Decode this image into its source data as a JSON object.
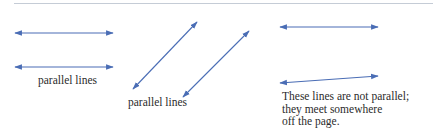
{
  "figure": {
    "line_color": "#4a6db5",
    "text_color": "#2b2b2b",
    "rule_color": "#c5ccd6",
    "groups": [
      {
        "id": "left-pair",
        "label": "parallel lines",
        "lines": [
          {
            "x1": 15,
            "y1": 33,
            "x2": 113,
            "y2": 33
          },
          {
            "x1": 15,
            "y1": 67,
            "x2": 113,
            "y2": 67
          }
        ]
      },
      {
        "id": "diagonal-pair",
        "label": "parallel lines",
        "lines": [
          {
            "x1": 133,
            "y1": 89,
            "x2": 197,
            "y2": 22
          },
          {
            "x1": 183,
            "y1": 97,
            "x2": 249,
            "y2": 31
          }
        ]
      },
      {
        "id": "non-parallel-pair",
        "label_lines": [
          "These lines are not parallel;",
          "they meet somewhere",
          "off the page."
        ],
        "lines": [
          {
            "x1": 280,
            "y1": 27,
            "x2": 378,
            "y2": 27
          },
          {
            "x1": 280,
            "y1": 83,
            "x2": 378,
            "y2": 76
          }
        ]
      }
    ]
  }
}
